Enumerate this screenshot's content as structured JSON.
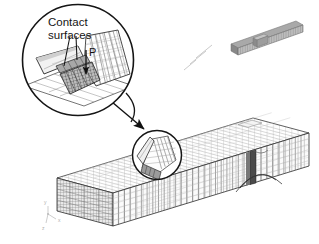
{
  "figure": {
    "background_color": "#ffffff",
    "line_color": "#1a1a1a",
    "mesh_color": "#555555",
    "shade_light": "#f0f0f0",
    "shade_mid": "#c8c8c8",
    "shade_dark": "#8a8a8a"
  },
  "detail_callout": {
    "name": "magnified-detail-circle",
    "label_line_1": "Contact",
    "label_line_2": "surfaces",
    "load_label": "P",
    "center": {
      "x": 78,
      "y": 60
    },
    "radius": 56
  },
  "beam_detail_circle": {
    "name": "crack-region-circle",
    "center": {
      "x": 157,
      "y": 155
    },
    "radius": 25
  },
  "leader_arrow": {
    "name": "detail-leader-arrow",
    "from": {
      "x": 112,
      "y": 102
    },
    "to": {
      "x": 146,
      "y": 131
    }
  },
  "main_model": {
    "name": "beam-mesh-model",
    "elements_along_length": 34,
    "elements_through_depth": 6,
    "notch_position_fraction": 0.74
  },
  "thumbnail_model": {
    "name": "beam-thumbnail",
    "center": {
      "x": 268,
      "y": 37
    }
  },
  "axis_triad": {
    "name": "coordinate-axis-triad",
    "origin": {
      "x": 48,
      "y": 228
    },
    "labels": [
      "y",
      "x",
      "z"
    ]
  }
}
